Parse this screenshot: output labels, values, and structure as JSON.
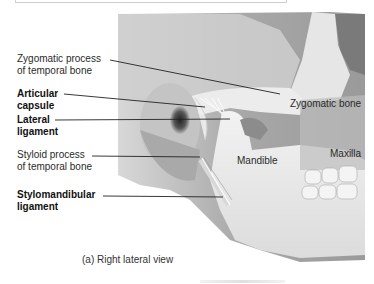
{
  "figure": {
    "caption": "(a) Right lateral view",
    "labels_left": [
      {
        "id": "zygomatic-process",
        "text": "Zygomatic process\nof temporal bone",
        "bold": false
      },
      {
        "id": "articular-capsule",
        "text": "Articular\ncapsule",
        "bold": true
      },
      {
        "id": "lateral-ligament",
        "text": "Lateral\nligament",
        "bold": true
      },
      {
        "id": "styloid-process",
        "text": "Styloid process\nof temporal bone",
        "bold": false
      },
      {
        "id": "stylomandibular-ligament",
        "text": "Stylomandibular\nligament",
        "bold": true
      }
    ],
    "labels_inline": [
      {
        "id": "zygomatic-bone",
        "text": "Zygomatic bone"
      },
      {
        "id": "mandible",
        "text": "Mandible"
      },
      {
        "id": "maxilla",
        "text": "Maxilla"
      }
    ]
  },
  "colors": {
    "leader_line": "#222222",
    "text": "#2a2a2a",
    "bone_light": "#ececec",
    "bone_mid": "#c8c8c8",
    "bone_dark": "#8a8a8a",
    "background_skull": "#b5b5b5"
  }
}
